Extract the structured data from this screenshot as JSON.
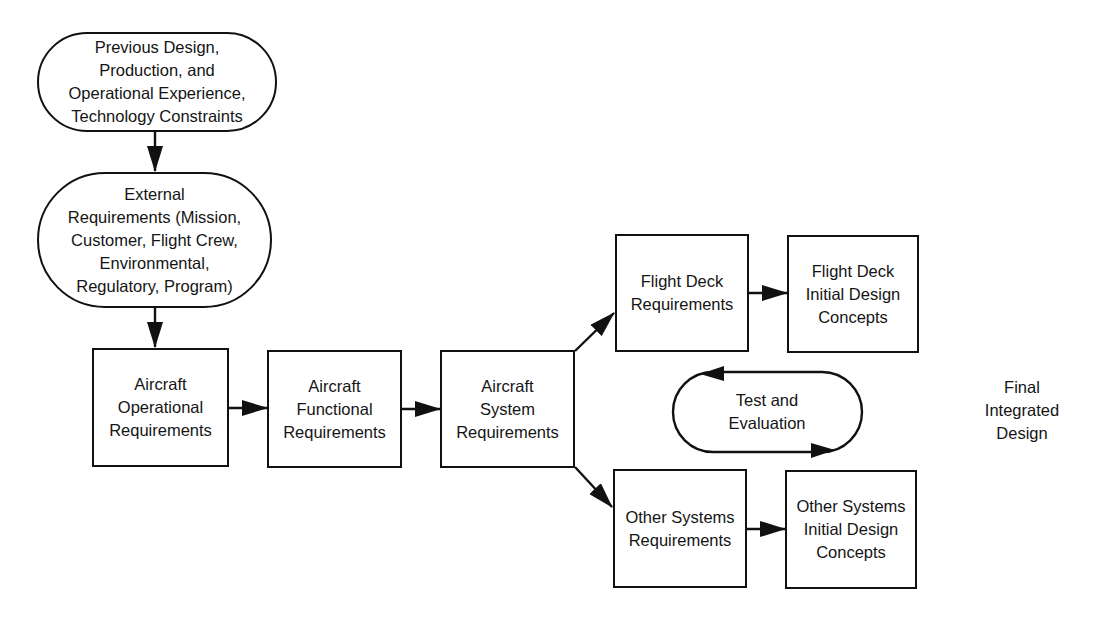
{
  "diagram": {
    "nodes": {
      "previous_design": {
        "label": "Previous Design,\nProduction, and\nOperational Experience,\nTechnology Constraints",
        "shape": "stadium"
      },
      "external_requirements": {
        "label": "External\nRequirements (Mission,\nCustomer, Flight Crew,\nEnvironmental,\nRegulatory, Program)",
        "shape": "stadium"
      },
      "aircraft_operational": {
        "label": "Aircraft\nOperational\nRequirements",
        "shape": "rectangle"
      },
      "aircraft_functional": {
        "label": "Aircraft\nFunctional\nRequirements",
        "shape": "rectangle"
      },
      "aircraft_system": {
        "label": "Aircraft\nSystem\nRequirements",
        "shape": "rectangle"
      },
      "flight_deck_requirements": {
        "label": "Flight Deck\nRequirements",
        "shape": "rectangle"
      },
      "flight_deck_initial_design": {
        "label": "Flight Deck\nInitial Design\nConcepts",
        "shape": "rectangle"
      },
      "test_and_evaluation": {
        "label": "Test and\nEvaluation",
        "shape": "stadium-loop"
      },
      "other_systems_requirements": {
        "label": "Other Systems\nRequirements",
        "shape": "rectangle"
      },
      "other_systems_initial_design": {
        "label": "Other Systems\nInitial Design\nConcepts",
        "shape": "rectangle"
      },
      "final_integrated_design": {
        "label": "Final\nIntegrated\nDesign",
        "shape": "text"
      }
    },
    "edges": [
      {
        "from": "previous_design",
        "to": "external_requirements"
      },
      {
        "from": "external_requirements",
        "to": "aircraft_operational"
      },
      {
        "from": "aircraft_operational",
        "to": "aircraft_functional"
      },
      {
        "from": "aircraft_functional",
        "to": "aircraft_system"
      },
      {
        "from": "aircraft_system",
        "to": "flight_deck_requirements"
      },
      {
        "from": "aircraft_system",
        "to": "other_systems_requirements"
      },
      {
        "from": "flight_deck_requirements",
        "to": "flight_deck_initial_design"
      },
      {
        "from": "other_systems_requirements",
        "to": "other_systems_initial_design"
      },
      {
        "from": "test_and_evaluation",
        "to": "test_and_evaluation",
        "type": "loop"
      }
    ],
    "colors": {
      "stroke": "#111111",
      "background": "#ffffff",
      "text": "#151515"
    }
  }
}
